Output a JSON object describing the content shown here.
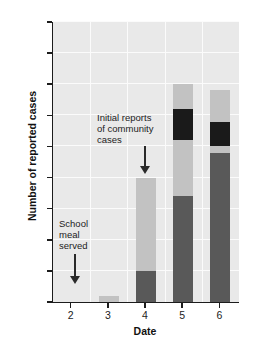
{
  "chart_data": {
    "type": "bar",
    "subtype": "stacked-bar",
    "title": "",
    "xlabel": "Date",
    "ylabel": "Number of reported cases",
    "categories": [
      "2",
      "3",
      "4",
      "5",
      "6"
    ],
    "ylim": [
      0,
      45
    ],
    "yticks": [
      0,
      5,
      10,
      15,
      20,
      25,
      30,
      35,
      40,
      45
    ],
    "ytick_labels": [
      "0",
      "5",
      "10",
      "15",
      "20",
      "25",
      "30",
      "35",
      "40",
      "45"
    ],
    "grid": "horizontal-and-vertical",
    "legend": "none",
    "colors": {
      "dark_gray": "#595959",
      "light_gray": "#c2c2c2",
      "black": "#1a1a1a",
      "plot_background": "#e9e9e9",
      "gridline": "#fbfbfb",
      "axis": "#1c1c1c"
    },
    "series": [
      {
        "name": "dark-gray-segment",
        "color": "#595959",
        "values": [
          0,
          0,
          5,
          17,
          24
        ]
      },
      {
        "name": "light-gray-segment",
        "color": "#c2c2c2",
        "values": [
          0,
          1,
          15,
          9,
          1
        ]
      },
      {
        "name": "black-segment",
        "color": "#1a1a1a",
        "values": [
          0,
          0,
          0,
          5,
          4
        ]
      },
      {
        "name": "light-gray-top",
        "color": "#c2c2c2",
        "values": [
          0,
          0,
          0,
          4,
          5
        ]
      }
    ],
    "totals": [
      0,
      1,
      20,
      35,
      34
    ],
    "annotations": [
      {
        "id": "school-meal-served",
        "lines": [
          "School",
          "meal",
          "served"
        ],
        "text": "School meal served",
        "points_to_category": "2",
        "arrow": "down"
      },
      {
        "id": "initial-community-reports",
        "lines": [
          "Initial reports",
          "of community",
          "cases"
        ],
        "text": "Initial reports of community cases",
        "points_to_category": "4",
        "arrow": "down"
      }
    ]
  }
}
